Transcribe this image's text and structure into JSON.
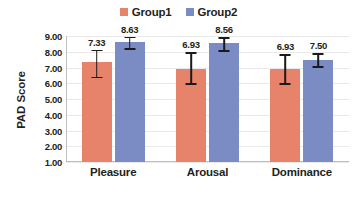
{
  "chart_data": {
    "type": "bar",
    "title": "",
    "subtitle": "",
    "xlabel": "",
    "ylabel": "PAD Score",
    "categories": [
      "Pleasure",
      "Arousal",
      "Dominance"
    ],
    "ylim": [
      1.0,
      9.0
    ],
    "ytick_step": 1.0,
    "ytick_labels": [
      "9.00",
      "8.00",
      "7.00",
      "6.00",
      "5.00",
      "4.00",
      "3.00",
      "2.00",
      "1.00"
    ],
    "ytick_values": [
      9.0,
      8.0,
      7.0,
      6.0,
      5.0,
      4.0,
      3.0,
      2.0,
      1.0
    ],
    "grid": "horizontal",
    "legend_position": "top-center",
    "series": [
      {
        "name": "Group1",
        "color": "#E8836B",
        "values": [
          7.33,
          6.93,
          6.93
        ],
        "value_labels": [
          "7.33",
          "6.93",
          "6.93"
        ],
        "error_low": [
          6.42,
          5.99,
          6.0
        ],
        "error_high": [
          8.12,
          7.96,
          7.86
        ]
      },
      {
        "name": "Group2",
        "color": "#7B8BC4",
        "values": [
          8.63,
          8.56,
          7.5
        ],
        "value_labels": [
          "8.63",
          "8.56",
          "7.50"
        ],
        "error_low": [
          8.23,
          8.08,
          7.08
        ],
        "error_high": [
          8.95,
          8.92,
          7.92
        ]
      }
    ]
  },
  "legend": {
    "entries": [
      {
        "label": "Group1",
        "color": "#E8836B"
      },
      {
        "label": "Group2",
        "color": "#7B8BC4"
      }
    ]
  },
  "axis": {
    "y_title": "PAD Score"
  },
  "colors": {
    "group1": "#E8836B",
    "group2": "#7B8BC4",
    "gridline": "#E9E9E9",
    "axis": "#BFBFBF",
    "text": "#231F20",
    "error": "#1A1A1A",
    "background": "#FFFFFF"
  }
}
